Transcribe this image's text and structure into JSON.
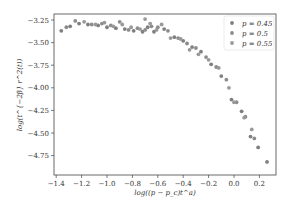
{
  "chart_data": {
    "type": "scatter",
    "title": "",
    "xlabel": "log((p − p_c)t^a)",
    "ylabel": "log(t^{−2β} r^2(t))",
    "xlim": [
      -1.42,
      0.33
    ],
    "ylim": [
      -4.95,
      -3.18
    ],
    "xticks": [
      -1.4,
      -1.2,
      -1.0,
      -0.8,
      -0.6,
      -0.4,
      -0.2,
      0.0,
      0.2
    ],
    "xtick_labels": [
      "−1.4",
      "−1.2",
      "−1.0",
      "−0.8",
      "−0.6",
      "−0.4",
      "−0.2",
      "0.0",
      "0.2"
    ],
    "yticks": [
      -3.25,
      -3.5,
      -3.75,
      -4.0,
      -4.25,
      -4.5,
      -4.75
    ],
    "ytick_labels": [
      "−3.25",
      "−3.50",
      "−3.75",
      "−4.00",
      "−4.25",
      "−4.50",
      "−4.75"
    ],
    "grid": false,
    "legend_position": "upper right",
    "series": [
      {
        "name": "p = 0.45",
        "color": "#7f7f7f",
        "x": [
          -1.36,
          -1.29,
          -1.22,
          -1.15,
          -1.07,
          -1.0,
          -0.93,
          -0.86,
          -0.79,
          -0.72,
          -0.68,
          -0.63,
          -0.55,
          -0.47,
          -0.4,
          -0.33,
          -0.26,
          -0.18,
          -0.1,
          -0.02,
          0.06,
          0.13,
          0.19,
          0.26
        ],
        "y": [
          -3.37,
          -3.32,
          -3.29,
          -3.3,
          -3.31,
          -3.33,
          -3.34,
          -3.35,
          -3.37,
          -3.38,
          -3.33,
          -3.38,
          -3.35,
          -3.44,
          -3.48,
          -3.55,
          -3.6,
          -3.74,
          -3.87,
          -4.13,
          -4.26,
          -4.54,
          -4.66,
          -4.82
        ]
      },
      {
        "name": "p = 0.5",
        "color": "#8c8c8c",
        "x": [
          -1.32,
          -1.25,
          -1.12,
          -1.04,
          -0.97,
          -0.9,
          -0.83,
          -0.76,
          -0.7,
          -0.65,
          -0.6,
          -0.52,
          -0.44,
          -0.37,
          -0.3,
          -0.22,
          -0.14,
          -0.06,
          0.02,
          0.09,
          0.16
        ],
        "y": [
          -3.33,
          -3.26,
          -3.3,
          -3.29,
          -3.31,
          -3.27,
          -3.36,
          -3.34,
          -3.36,
          -3.32,
          -3.33,
          -3.37,
          -3.45,
          -3.51,
          -3.56,
          -3.66,
          -3.77,
          -3.91,
          -4.16,
          -4.32,
          -4.56
        ]
      },
      {
        "name": "p = 0.55",
        "color": "#999999",
        "x": [
          -1.18,
          -1.09,
          -1.02,
          -0.95,
          -0.88,
          -0.81,
          -0.74,
          -0.7,
          -0.66,
          -0.61,
          -0.57,
          -0.5,
          -0.42,
          -0.35,
          -0.28,
          -0.2,
          -0.12,
          -0.04,
          0.0,
          0.08,
          0.14
        ],
        "y": [
          -3.27,
          -3.3,
          -3.28,
          -3.32,
          -3.3,
          -3.33,
          -3.35,
          -3.24,
          -3.29,
          -3.36,
          -3.3,
          -3.45,
          -3.46,
          -3.58,
          -3.63,
          -3.69,
          -3.78,
          -4.0,
          -4.16,
          -4.33,
          -4.46
        ]
      }
    ]
  },
  "legend": {
    "items": [
      {
        "label": "p = 0.45",
        "color": "#7f7f7f"
      },
      {
        "label": "p = 0.5",
        "color": "#8c8c8c"
      },
      {
        "label": "p = 0.55",
        "color": "#999999"
      }
    ]
  }
}
